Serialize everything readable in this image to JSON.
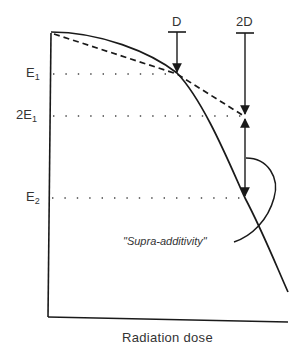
{
  "diagram": {
    "x_axis_label": "Radiation dose",
    "y_labels": {
      "e1": {
        "main": "E",
        "sub": "1"
      },
      "two_e1": {
        "main": "2E",
        "sub": "1"
      },
      "e2": {
        "main": "E",
        "sub": "2"
      }
    },
    "dose_markers": {
      "d": "D",
      "two_d": "2D"
    },
    "annotation": "\"Supra-additivity\"",
    "colors": {
      "line": "#1a1a1a",
      "text": "#333333",
      "background": "#ffffff"
    }
  }
}
